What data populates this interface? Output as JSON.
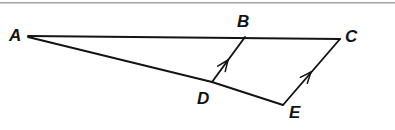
{
  "figure": {
    "kind": "geometry-diagram",
    "width": 395,
    "height": 130,
    "background_color": "#ffffff",
    "stroke_color": "#131313",
    "top_rule_color": "#888888",
    "points": [
      {
        "id": "A",
        "label": "A",
        "x": 28,
        "y": 36,
        "label_x": 9,
        "label_y": 27
      },
      {
        "id": "B",
        "label": "B",
        "x": 245,
        "y": 36,
        "label_x": 237,
        "label_y": 13
      },
      {
        "id": "C",
        "label": "C",
        "x": 340,
        "y": 39,
        "label_x": 345,
        "label_y": 28
      },
      {
        "id": "D",
        "label": "D",
        "x": 212,
        "y": 82,
        "label_x": 197,
        "label_y": 90
      },
      {
        "id": "E",
        "label": "E",
        "x": 283,
        "y": 105,
        "label_x": 289,
        "label_y": 104
      }
    ],
    "segments": [
      {
        "id": "AC",
        "from": "A",
        "to": "C",
        "x1": 28,
        "y1": 36,
        "x2": 340,
        "y2": 39,
        "width": 1.9,
        "arrow": false
      },
      {
        "id": "AD",
        "from": "A",
        "to": "D",
        "x1": 28,
        "y1": 37,
        "x2": 212,
        "y2": 82,
        "width": 1.9,
        "arrow": false
      },
      {
        "id": "DE",
        "from": "D",
        "to": "E",
        "x1": 212,
        "y1": 82,
        "x2": 283,
        "y2": 105,
        "width": 1.9,
        "arrow": false
      },
      {
        "id": "DB",
        "from": "D",
        "to": "B",
        "x1": 212,
        "y1": 82,
        "x2": 245,
        "y2": 37,
        "width": 1.9,
        "arrow": true,
        "arrow_x": 228,
        "arrow_y": 60
      },
      {
        "id": "EC",
        "from": "E",
        "to": "C",
        "x1": 283,
        "y1": 105,
        "x2": 340,
        "y2": 39,
        "width": 1.9,
        "arrow": true,
        "arrow_x": 311,
        "arrow_y": 72
      }
    ],
    "parallel_marks": {
      "style": "single-arrowhead",
      "segments": [
        "DB",
        "EC"
      ],
      "direction": "toward upper endpoint"
    }
  }
}
